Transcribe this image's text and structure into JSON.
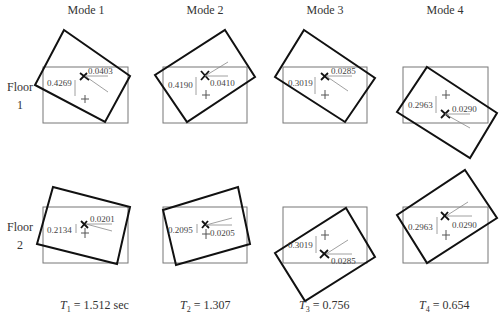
{
  "headers": {
    "mode1": "Mode 1",
    "mode2": "Mode 2",
    "mode3": "Mode 3",
    "mode4": "Mode 4"
  },
  "floors": {
    "floor1": {
      "word": "Floor",
      "num": "1"
    },
    "floor2": {
      "word": "Floor",
      "num": "2"
    }
  },
  "panels": {
    "m1f1": {
      "vertical_disp": "0.4269",
      "rotation": "0.0403"
    },
    "m2f1": {
      "vertical_disp": "0.4190",
      "rotation": "0.0410"
    },
    "m3f1": {
      "vertical_disp": "0.3019",
      "rotation": "0.0285"
    },
    "m4f1": {
      "vertical_disp": "0.2963",
      "rotation": "0.0290"
    },
    "m1f2": {
      "vertical_disp": "0.2134",
      "rotation": "0.0201"
    },
    "m2f2": {
      "vertical_disp": "0.2095",
      "rotation": "0.0205"
    },
    "m3f2": {
      "vertical_disp": "0.3019",
      "rotation": "0.0285"
    },
    "m4f2": {
      "vertical_disp": "0.2963",
      "rotation": "0.0290"
    }
  },
  "periods": {
    "t1": {
      "sym": "T",
      "sub": "1",
      "text": " = 1.512 sec"
    },
    "t2": {
      "sym": "T",
      "sub": "2",
      "text": " = 1.307"
    },
    "t3": {
      "sym": "T",
      "sub": "3",
      "text": " = 0.756"
    },
    "t4": {
      "sym": "T",
      "sub": "4",
      "text": " = 0.654"
    }
  },
  "theta_symbol": "θ",
  "colors": {
    "reference_outline": "#777777",
    "deformed_outline": "#111111",
    "annotation": "#888888"
  }
}
